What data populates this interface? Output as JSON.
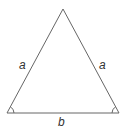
{
  "diagram": {
    "shape": "isosceles-triangle",
    "labels": {
      "left_side": "a",
      "right_side": "a",
      "base": "b"
    },
    "marks": {
      "base_left_vertex": "angle-arc",
      "base_right_vertex": "angle-arc",
      "apex": "none"
    },
    "colors": {
      "line": "#666666",
      "text": "#333333",
      "background": "#ffffff"
    }
  }
}
